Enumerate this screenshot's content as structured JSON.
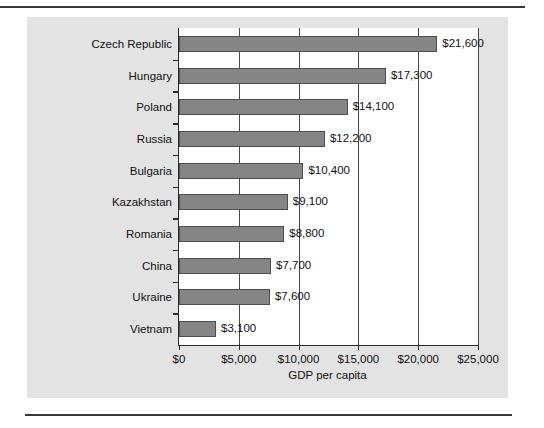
{
  "chart_data": {
    "type": "bar",
    "orientation": "horizontal",
    "title": "",
    "xlabel": "GDP per capita",
    "ylabel": "",
    "categories": [
      "Czech Republic",
      "Hungary",
      "Poland",
      "Russia",
      "Bulgaria",
      "Kazakhstan",
      "Romania",
      "China",
      "Ukraine",
      "Vietnam"
    ],
    "values": [
      21600,
      17300,
      14100,
      12200,
      10400,
      9100,
      8800,
      7700,
      7600,
      3100
    ],
    "data_labels": [
      "$21,600",
      "$17,300",
      "$14,100",
      "$12,200",
      "$10,400",
      "$9,100",
      "$8,800",
      "$7,700",
      "$7,600",
      "$3,100"
    ],
    "xlim": [
      0,
      25000
    ],
    "xticks": [
      0,
      5000,
      10000,
      15000,
      20000,
      25000
    ],
    "xticklabels": [
      "$0",
      "$5,000",
      "$10,000",
      "$15,000",
      "$20,000",
      "$25,000"
    ],
    "grid": "vertical",
    "legend": null,
    "colors": {
      "bar_fill": "#858585",
      "bar_edge": "#4d4d4d",
      "panel_background": "#e3e3e3",
      "plot_background": "#ffffff",
      "axis": "#2b2b2b",
      "gridline": "#4a4a4a",
      "text": "#111111",
      "rule": "#3a3a3a"
    }
  }
}
